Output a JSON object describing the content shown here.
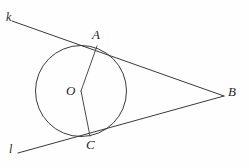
{
  "figure": {
    "kind": "geometry-diagram",
    "width": 249,
    "height": 168,
    "background_color": "#fefefe",
    "stroke_color": "#3a3a3a",
    "label_color": "#262626"
  },
  "circle": {
    "name": "circle-o",
    "center_x": 81,
    "center_y": 91,
    "radius": 45.5
  },
  "points": {
    "A": {
      "label": "A",
      "x": 97,
      "y": 46,
      "label_x": 92,
      "label_y": 28
    },
    "B": {
      "label": "B",
      "x": 224,
      "y": 96,
      "label_x": 228,
      "label_y": 85
    },
    "C": {
      "label": "C",
      "x": 90,
      "y": 136,
      "label_x": 86,
      "label_y": 138
    },
    "O": {
      "label": "O",
      "x": 81,
      "y": 91,
      "label_x": 66,
      "label_y": 84
    }
  },
  "lines": {
    "k": {
      "label": "k",
      "label_x": 6,
      "label_y": 11,
      "x1": 12,
      "y1": 21,
      "x2": 224,
      "y2": 96
    },
    "l": {
      "label": "l",
      "label_x": 9,
      "label_y": 143,
      "x1": 18,
      "y1": 153,
      "x2": 224,
      "y2": 96
    }
  },
  "segments": {
    "OA": {
      "name": "radius-oa",
      "x1": 81,
      "y1": 91,
      "x2": 97,
      "y2": 46
    },
    "OC": {
      "name": "radius-oc",
      "x1": 81,
      "y1": 91,
      "x2": 90,
      "y2": 136
    }
  }
}
